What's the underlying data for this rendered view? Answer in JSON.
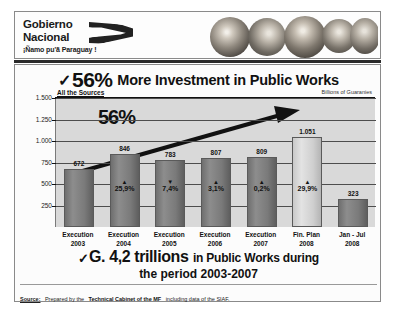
{
  "header": {
    "logo_line1": "Gobierno",
    "logo_line2": "Nacional",
    "logo_tagline": "¡Ñamo pu'ã Paraguay !",
    "logo_mark_name": "ribbon-flag-icon",
    "photos_alt": "children-photo-strip"
  },
  "title": {
    "check": "✓",
    "headline_number": "56%",
    "headline_rest": "More Investment in Public Works"
  },
  "chart_labels": {
    "sources_note": "All the Sources",
    "units_note": "Billions of Guaranies",
    "callout": "56%"
  },
  "footer": {
    "check": "✓",
    "amount": "G. 4,2 trillions",
    "line1_rest": "in Public Works during",
    "line2": "the period 2003-2007"
  },
  "source": {
    "label": "Source:",
    "text_before": "Prepared by the",
    "text_bold": "Technical Cabinet of the MF",
    "text_after": "including data of the SIAF."
  },
  "colors": {
    "plot_bg": "#d9d9d9",
    "bar_dark": "#7a7a7a",
    "bar_light": "#cfcfcf",
    "text": "#111111",
    "grid": "#4d4d4d"
  },
  "chart_data": {
    "type": "bar",
    "subtitle": "All the Sources",
    "xlabel": "",
    "ylabel": "Billions of Guaranies",
    "ylim": [
      0,
      1500
    ],
    "yticks": [
      "250",
      "500",
      "750",
      "1.000",
      "1.250",
      "1.500"
    ],
    "ytick_values": [
      250,
      500,
      750,
      1000,
      1250,
      1500
    ],
    "grid": true,
    "legend": "none",
    "categories": [
      "Execution 2003",
      "Execution 2004",
      "Execution 2005",
      "Execution 2006",
      "Execution 2007",
      "Fin. Plan 2008",
      "Jan - Jul 2008"
    ],
    "category_lines": [
      [
        "Execution",
        "2003"
      ],
      [
        "Execution",
        "2004"
      ],
      [
        "Execution",
        "2005"
      ],
      [
        "Execution",
        "2006"
      ],
      [
        "Execution",
        "2007"
      ],
      [
        "Fin. Plan",
        "2008"
      ],
      [
        "Jan - Jul",
        "2008"
      ]
    ],
    "values": [
      672,
      846,
      783,
      807,
      809,
      1051,
      323
    ],
    "value_labels": [
      "672",
      "846",
      "783",
      "807",
      "809",
      "1.051",
      "323"
    ],
    "bar_styles": [
      "dark",
      "dark",
      "dark",
      "dark",
      "dark",
      "light",
      "dark"
    ],
    "growth_labels": [
      {
        "arrow": "",
        "text": ""
      },
      {
        "arrow": "▲",
        "text": "25,9%"
      },
      {
        "arrow": "▼",
        "text": "7,4%"
      },
      {
        "arrow": "▲",
        "text": "3,1%"
      },
      {
        "arrow": "▲",
        "text": "0,2%"
      },
      {
        "arrow": "▲",
        "text": "29,9%"
      },
      {
        "arrow": "",
        "text": ""
      }
    ],
    "annotations": [
      {
        "name": "growth-callout",
        "text": "56%"
      },
      {
        "name": "trend-arrow",
        "text": ""
      }
    ]
  }
}
